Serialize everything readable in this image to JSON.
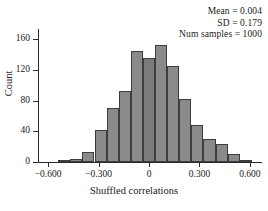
{
  "chart_data": {
    "type": "bar",
    "title": "",
    "xlabel": "Shuffled correlations",
    "ylabel": "Count",
    "xlim": [
      -0.66,
      0.66
    ],
    "ylim": [
      0,
      172
    ],
    "grid": false,
    "legend_position": "none",
    "bin_width": 0.072,
    "bin_centers": [
      -0.504,
      -0.432,
      -0.36,
      -0.288,
      -0.216,
      -0.144,
      -0.072,
      0.0,
      0.072,
      0.144,
      0.216,
      0.288,
      0.36,
      0.432,
      0.504,
      0.576
    ],
    "bin_edges": [
      -0.54,
      -0.468,
      -0.396,
      -0.324,
      -0.252,
      -0.18,
      -0.108,
      -0.036,
      0.036,
      0.108,
      0.18,
      0.252,
      0.324,
      0.396,
      0.468,
      0.54,
      0.612
    ],
    "values": [
      2,
      4,
      13,
      42,
      70,
      92,
      145,
      136,
      153,
      125,
      82,
      48,
      30,
      24,
      11,
      2
    ],
    "xticks": [
      -0.6,
      -0.3,
      0,
      0.3,
      0.6
    ],
    "xtick_labels": [
      "−0.600",
      "−0.300",
      "0",
      "0.300",
      "0.600"
    ],
    "yticks": [
      0,
      40,
      80,
      120,
      160
    ],
    "ytick_labels": [
      "0",
      "40",
      "80",
      "120",
      "160"
    ],
    "bar_color": "#8a8a8a",
    "bar_edge_color": "#3d3d3d",
    "annotations": [
      "Mean = 0.004",
      "SD = 0.179",
      "Num samples = 1000"
    ],
    "statistics": {
      "mean": 0.004,
      "sd": 0.179,
      "num_samples": 1000
    }
  }
}
